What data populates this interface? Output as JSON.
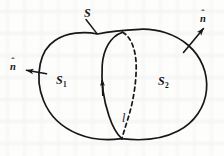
{
  "figure": {
    "kind": "vector-calculus-surface-diagram",
    "background_color": "#fdfdfc",
    "ink_color": "#17171a"
  },
  "labels": {
    "surface": "S",
    "subsurface_left_base": "S",
    "subsurface_left_sub": "1",
    "subsurface_right_base": "S",
    "subsurface_right_sub": "2",
    "boundary_curve": "l",
    "normal_left_base": "n",
    "normal_left_hat": "ˆ",
    "normal_right_base": "n",
    "normal_right_hat": "ˆ"
  },
  "graphics": {
    "outer_boundary_name": "closed-surface-outline",
    "divider_solid_name": "dividing-curve-front-solid",
    "divider_dashed_name": "dividing-curve-back-dashed",
    "leader_line_name": "surface-label-leader-line",
    "arrow_left_name": "normal-vector-arrow-left",
    "arrow_right_name": "normal-vector-arrow-right",
    "arrow_on_curve_name": "orientation-arrowhead-on-curve",
    "stroke_width": "1.7",
    "dash_pattern": "4,3.4"
  }
}
